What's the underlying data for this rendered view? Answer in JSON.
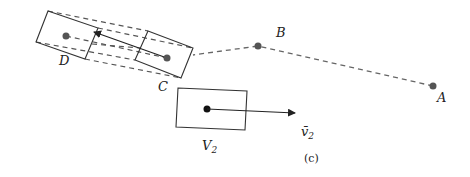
{
  "figure": {
    "caption": "(c)",
    "points": [
      {
        "id": "A",
        "label": "A"
      },
      {
        "id": "B",
        "label": "B"
      },
      {
        "id": "C",
        "label": "C"
      },
      {
        "id": "D",
        "label": "D"
      }
    ],
    "volume_label": "V",
    "volume_subscript": "2",
    "velocity_label": "v̄",
    "velocity_subscript": "2",
    "colors": {
      "ink": "#222222",
      "dashed_path": "#666666",
      "point": "#555555"
    }
  }
}
